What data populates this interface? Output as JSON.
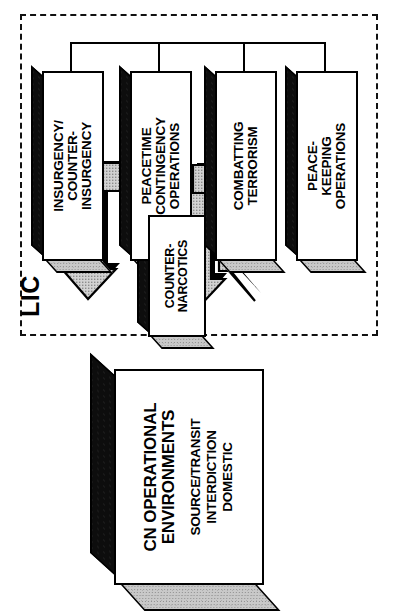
{
  "diagram": {
    "title_label": "LIC",
    "enclosure_name": "LIC",
    "lic_boxes": [
      {
        "id": "insurgency",
        "title": "INSURGENCY/\nCOUNTER-\nINSURGENCY"
      },
      {
        "id": "peacetime",
        "title": "PEACETIME\nCONTINGENCY\nOPERATIONS"
      },
      {
        "id": "terrorism",
        "title": "COMBATTING\nTERRORISM"
      },
      {
        "id": "peacekeeping",
        "title": "PEACE-\nKEEPING\nOPERATIONS"
      }
    ],
    "center_box": {
      "id": "counter-narcotics",
      "title": "COUNTER-\nNARCOTICS"
    },
    "base_box": {
      "id": "cn-operational-environments",
      "title": "CN OPERATIONAL\nENVIRONMENTS",
      "items": "SOURCE/TRANSIT\nINTERDICTION\nDOMESTIC"
    },
    "colors": {
      "line": "#000000",
      "box_face": "#ffffff",
      "box_top_dark": "#0d0d0d",
      "box_side_light": "#c9c9c9",
      "arrow_fill": "#c8c8c8",
      "arrow_shadow": "#000000",
      "background": "#ffffff"
    }
  }
}
